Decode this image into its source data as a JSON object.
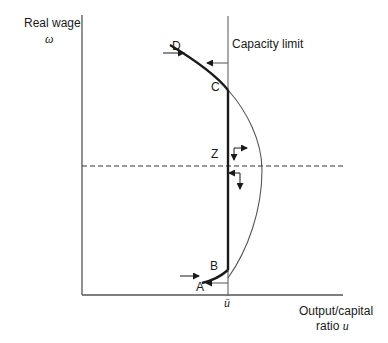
{
  "diagram": {
    "y_axis": {
      "label": "Real wage",
      "symbol": "ω"
    },
    "x_axis": {
      "label_line1": "Output/capital",
      "label_line2_text": "ratio",
      "label_line2_symbol": "u"
    },
    "capacity_limit": {
      "label": "Capacity limit",
      "tick_symbol": "ū"
    },
    "points": {
      "A": "A",
      "B": "B",
      "C": "C",
      "D": "D",
      "Z": "Z"
    },
    "colors": {
      "ink": "#1a1a1a",
      "axis": "#555555",
      "thin_curve": "#555555"
    }
  }
}
